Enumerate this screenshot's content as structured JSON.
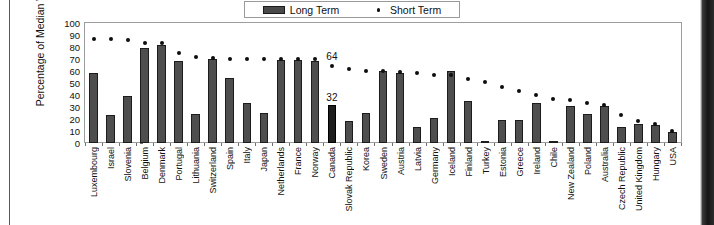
{
  "chart_data": {
    "type": "bar",
    "title": "",
    "subtitle": "",
    "xlabel": "",
    "ylabel": "Percentage of Median Wage",
    "ylim": [
      0,
      100
    ],
    "y_ticks": [
      100,
      90,
      80,
      70,
      60,
      50,
      40,
      30,
      20,
      10,
      0
    ],
    "grid": false,
    "legend_position": "top-center",
    "legend": [
      "Long Term",
      "Short Term"
    ],
    "categories": [
      "Luxembourg",
      "Israel",
      "Slovenia",
      "Belgium",
      "Denmark",
      "Portugal",
      "Lithuania",
      "Switzerland",
      "Spain",
      "Italy",
      "Japan",
      "Netherlands",
      "France",
      "Norway",
      "Canada",
      "Slovak Republic",
      "Korea",
      "Sweden",
      "Austria",
      "Latvia",
      "Germany",
      "Iceland",
      "Finland",
      "Turkey",
      "Estonia",
      "Greece",
      "Ireland",
      "Chile",
      "New Zealand",
      "Poland",
      "Australia",
      "Czech Republic",
      "United Kingdom",
      "Hungary",
      "USA"
    ],
    "series": [
      {
        "name": "Long Term",
        "type": "bar",
        "color": "#4e4e4e",
        "values": [
          58,
          23,
          39,
          79,
          82,
          68,
          24,
          70,
          54,
          33,
          25,
          69,
          69,
          68,
          32,
          18,
          25,
          60,
          58,
          13,
          21,
          60,
          35,
          1,
          19,
          19,
          33,
          2,
          31,
          24,
          31,
          13,
          16,
          15,
          9
        ]
      },
      {
        "name": "Short Term",
        "type": "scatter",
        "color": "#0d0d0d",
        "values": [
          87,
          87,
          86,
          83,
          83,
          75,
          72,
          71,
          70,
          70,
          70,
          70,
          70,
          70,
          64,
          62,
          60,
          60,
          59,
          58,
          57,
          57,
          53,
          51,
          47,
          43,
          40,
          37,
          36,
          33,
          32,
          23,
          18,
          16,
          10
        ]
      }
    ],
    "annotations": [
      {
        "category": "Canada",
        "series": "Short Term",
        "text": "64"
      },
      {
        "category": "Canada",
        "series": "Long Term",
        "text": "32"
      }
    ],
    "highlight_category": "Canada"
  }
}
